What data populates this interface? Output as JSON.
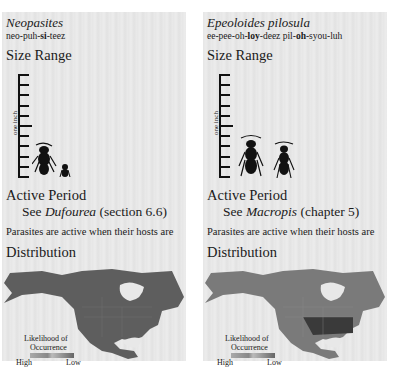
{
  "panels": [
    {
      "species": "Neopasites",
      "pronunciation": [
        {
          "text": "neo-puh-",
          "bold": false
        },
        {
          "text": "si",
          "bold": true
        },
        {
          "text": "-teez",
          "bold": false
        }
      ],
      "size_heading": "Size Range",
      "ruler_label": "one inch",
      "active_heading": "Active Period",
      "see_prefix": "See ",
      "see_genus": "Dufourea",
      "see_suffix": " (section 6.6)",
      "note": "Parasites are active when their hosts are",
      "distribution_heading": "Distribution",
      "legend": {
        "title1": "Likelihood of",
        "title2": "Occurrence",
        "high": "High",
        "low": "Low"
      }
    },
    {
      "species": "Epeoloides pilosula",
      "pronunciation": [
        {
          "text": "ee-pee-oh-",
          "bold": false
        },
        {
          "text": "loy",
          "bold": true
        },
        {
          "text": "-deez pil-",
          "bold": false
        },
        {
          "text": "oh",
          "bold": true
        },
        {
          "text": "-syou-luh",
          "bold": false
        }
      ],
      "size_heading": "Size Range",
      "ruler_label": "one inch",
      "active_heading": "Active Period",
      "see_prefix": "See ",
      "see_genus": "Macropis",
      "see_suffix": " (chapter 5)",
      "note": "Parasites are active when their hosts are",
      "distribution_heading": "Distribution",
      "legend": {
        "title1": "Likelihood of",
        "title2": "Occurrence",
        "high": "High",
        "low": "Low"
      }
    }
  ]
}
